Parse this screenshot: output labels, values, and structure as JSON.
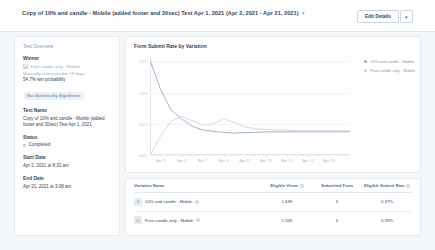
{
  "header": {
    "title": "Copy of 10% and candle - Mobile (added footer and 30sec) Test Apr 1, 2021 (Apr 2, 2021 - Apr 21, 2021)",
    "title_caret": "▾",
    "edit_details_label": "Edit Details",
    "edit_caret": "▾"
  },
  "sidebar": {
    "overview_label": "Test Overview",
    "winner_heading": "Winner",
    "winner_variation": "Free candle only - Mobile",
    "winner_chip": "B",
    "winner_selection": "Manually selected after 19 days",
    "winner_probability": "54.7% win probability",
    "significance_badge": "Not Statistically Significant",
    "test_name_heading": "Test Name",
    "test_name_value": "Copy of 10% and candle - Mobile (added footer and 30sec) Test Apr 1, 2021",
    "status_heading": "Status",
    "status_value": "Completed",
    "start_date_heading": "Start Date",
    "start_date_value": "Apr 2, 2021 at 8:33 am",
    "end_date_heading": "End Date",
    "end_date_value": "Apr 21, 2021 at 3:08 am"
  },
  "colors": {
    "series_a": "#99acc2",
    "series_b": "#cbd6e2",
    "text": "#33475b",
    "muted": "#7c98b6",
    "border": "#e5eaef"
  },
  "chart_data": {
    "type": "line",
    "title": "Form Submit Rate by Variation",
    "xlabel": "",
    "ylabel": "",
    "ylim": [
      0,
      1.6
    ],
    "yticks": [
      "0.0%",
      "0.5%",
      "1.0%",
      "1.5%"
    ],
    "ytick_values": [
      0,
      0.5,
      1.0,
      1.5
    ],
    "grid": true,
    "legend_position": "right",
    "x": [
      "Apr 2",
      "Apr 3",
      "Apr 4",
      "Apr 5",
      "Apr 6",
      "Apr 7",
      "Apr 8",
      "Apr 9",
      "Apr 10",
      "Apr 11",
      "Apr 12",
      "Apr 13",
      "Apr 14",
      "Apr 15",
      "Apr 16",
      "Apr 17",
      "Apr 18",
      "Apr 19",
      "Apr 20",
      "Apr 21"
    ],
    "xticks": [
      "Apr 3",
      "Apr 5",
      "Apr 7",
      "Apr 9",
      "Apr 11",
      "Apr 13",
      "Apr 15",
      "Apr 17",
      "Apr 19"
    ],
    "series": [
      {
        "name": "10% and candle - Mobile",
        "color": "#99acc2",
        "values": [
          1.52,
          1.05,
          0.72,
          0.58,
          0.46,
          0.4,
          0.38,
          0.36,
          0.35,
          0.36,
          0.36,
          0.37,
          0.37,
          0.37,
          0.37,
          0.37,
          0.37,
          0.37,
          0.37,
          0.37
        ]
      },
      {
        "name": "Free candle only - Mobile",
        "color": "#cbd6e2",
        "values": [
          0.0,
          0.3,
          0.54,
          0.62,
          0.55,
          0.48,
          0.5,
          0.58,
          0.52,
          0.45,
          0.42,
          0.41,
          0.4,
          0.4,
          0.39,
          0.39,
          0.39,
          0.39,
          0.39,
          0.39
        ]
      }
    ]
  },
  "table": {
    "columns": [
      {
        "label": "Variation Name",
        "info": false
      },
      {
        "label": "Eligible Views",
        "info": true
      },
      {
        "label": "Submitted Form",
        "info": false
      },
      {
        "label": "Eligible Submit Rate",
        "info": true
      }
    ],
    "rows": [
      {
        "chip": "A",
        "name": "10% and candle - Mobile",
        "eligible_views": "1.63K",
        "submitted_form": "6",
        "eligible_submit_rate": "0.37%"
      },
      {
        "chip": "B",
        "name": "Free candle only - Mobile",
        "eligible_views": "1.56K",
        "submitted_form": "6",
        "eligible_submit_rate": "0.39%"
      }
    ]
  }
}
